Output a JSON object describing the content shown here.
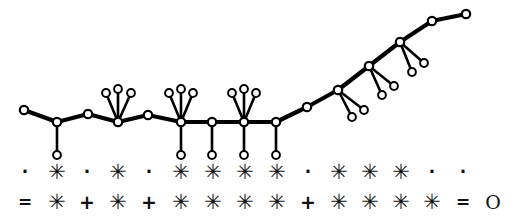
{
  "figure": {
    "background_color": "#ffffff",
    "stroke_color": "#000000",
    "node_fill_color": "#ffffff"
  },
  "tree": {
    "description": "Unrooted ladder-like tree: flat backbone on the left rising steeply to the upper right, with pendant leaf tips above and below backbone nodes.",
    "backbone_stroke_width": 4.2,
    "leaf_stroke_width": 2.6,
    "node_radius": 4.2,
    "backbone": [
      {
        "id": "b0",
        "x": 24,
        "y": 110
      },
      {
        "id": "b1",
        "x": 57,
        "y": 122
      },
      {
        "id": "b2",
        "x": 88,
        "y": 114
      },
      {
        "id": "b3",
        "x": 118,
        "y": 122
      },
      {
        "id": "b4",
        "x": 148,
        "y": 115
      },
      {
        "id": "b5",
        "x": 181,
        "y": 122
      },
      {
        "id": "b6",
        "x": 212,
        "y": 122
      },
      {
        "id": "b7",
        "x": 244,
        "y": 122
      },
      {
        "id": "b8",
        "x": 276,
        "y": 122
      },
      {
        "id": "b9",
        "x": 307,
        "y": 107
      },
      {
        "id": "b10",
        "x": 338,
        "y": 90
      },
      {
        "id": "b11",
        "x": 369,
        "y": 66
      },
      {
        "id": "b12",
        "x": 400,
        "y": 42
      },
      {
        "id": "b13",
        "x": 432,
        "y": 21
      },
      {
        "id": "b14",
        "x": 466,
        "y": 14
      }
    ],
    "leaves": [
      {
        "parent": "b1",
        "x": 57,
        "y": 155,
        "group": "down"
      },
      {
        "parent": "b3",
        "x": 106,
        "y": 93,
        "group": "fan-up"
      },
      {
        "parent": "b3",
        "x": 118,
        "y": 89,
        "group": "fan-up"
      },
      {
        "parent": "b3",
        "x": 131,
        "y": 93,
        "group": "fan-up"
      },
      {
        "parent": "b5",
        "x": 169,
        "y": 93,
        "group": "fan-up"
      },
      {
        "parent": "b5",
        "x": 181,
        "y": 89,
        "group": "fan-up"
      },
      {
        "parent": "b5",
        "x": 193,
        "y": 93,
        "group": "fan-up"
      },
      {
        "parent": "b5",
        "x": 181,
        "y": 155,
        "group": "down"
      },
      {
        "parent": "b6",
        "x": 212,
        "y": 155,
        "group": "down"
      },
      {
        "parent": "b7",
        "x": 232,
        "y": 93,
        "group": "fan-up"
      },
      {
        "parent": "b7",
        "x": 244,
        "y": 89,
        "group": "fan-up"
      },
      {
        "parent": "b7",
        "x": 256,
        "y": 93,
        "group": "fan-up"
      },
      {
        "parent": "b7",
        "x": 244,
        "y": 155,
        "group": "down"
      },
      {
        "parent": "b8",
        "x": 276,
        "y": 155,
        "group": "down"
      },
      {
        "parent": "b10",
        "x": 352,
        "y": 117,
        "group": "fan-downright"
      },
      {
        "parent": "b10",
        "x": 364,
        "y": 110,
        "group": "fan-downright"
      },
      {
        "parent": "b11",
        "x": 382,
        "y": 95,
        "group": "fan-downright"
      },
      {
        "parent": "b11",
        "x": 394,
        "y": 86,
        "group": "fan-downright"
      },
      {
        "parent": "b12",
        "x": 412,
        "y": 72,
        "group": "fan-downright"
      },
      {
        "parent": "b12",
        "x": 424,
        "y": 63,
        "group": "fan-downright"
      }
    ]
  },
  "symbol_rows": {
    "column_x": [
      25,
      57,
      87,
      118,
      149,
      181,
      213,
      245,
      277,
      308,
      339,
      370,
      401,
      432,
      463,
      493
    ],
    "row1": {
      "y": 172,
      "label": "character-state-row-1",
      "symbols": [
        "·",
        "✳",
        "·",
        "✳",
        "·",
        "✳",
        "✳",
        "✳",
        "✳",
        "·",
        "✳",
        "✳",
        "✳",
        "·",
        "·",
        ""
      ],
      "kinds": [
        "dot",
        "star",
        "dot",
        "star",
        "dot",
        "star",
        "star",
        "star",
        "star",
        "dot",
        "star",
        "star",
        "star",
        "dot",
        "dot",
        "none"
      ]
    },
    "row2": {
      "y": 202,
      "label": "character-state-row-2",
      "symbols": [
        "=",
        "✳",
        "+",
        "✳",
        "+",
        "✳",
        "✳",
        "✳",
        "✳",
        "+",
        "✳",
        "✳",
        "✳",
        "✳",
        "=",
        "O"
      ],
      "kinds": [
        "eq",
        "star",
        "plus",
        "star",
        "plus",
        "star",
        "star",
        "star",
        "star",
        "plus",
        "star",
        "star",
        "star",
        "star",
        "eq",
        "oh"
      ]
    }
  }
}
